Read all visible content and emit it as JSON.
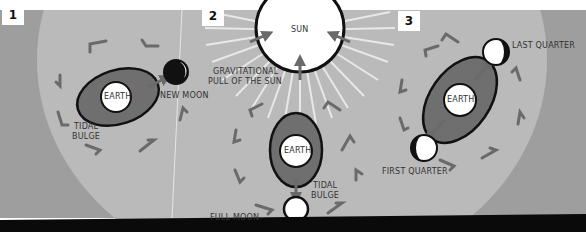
{
  "panels": [
    {
      "number": "1",
      "labels": {
        "earth": "EARTH",
        "moon": "NEW MOON",
        "bulge_line1": "TIDAL",
        "bulge_line2": "BULGE"
      }
    },
    {
      "number": "2",
      "labels": {
        "sun": "SUN",
        "pull_line1": "GRAVITATIONAL",
        "pull_line2": "PULL OF THE SUN",
        "earth": "EARTH",
        "moon": "FULL MOON",
        "bulge_line1": "TIDAL",
        "bulge_line2": "BULGE"
      }
    },
    {
      "number": "3",
      "labels": {
        "earth": "EARTH",
        "moon_top": "LAST QUARTER",
        "moon_bottom": "FIRST QUARTER"
      }
    }
  ],
  "colors": {
    "background_light": "#b9b9b9",
    "background_dark": "#9e9e9e",
    "bulge": "#6f6f6f",
    "arrow": "#6a6a6a",
    "outline": "#111111",
    "bottom_bar": "#0a0a0a"
  }
}
